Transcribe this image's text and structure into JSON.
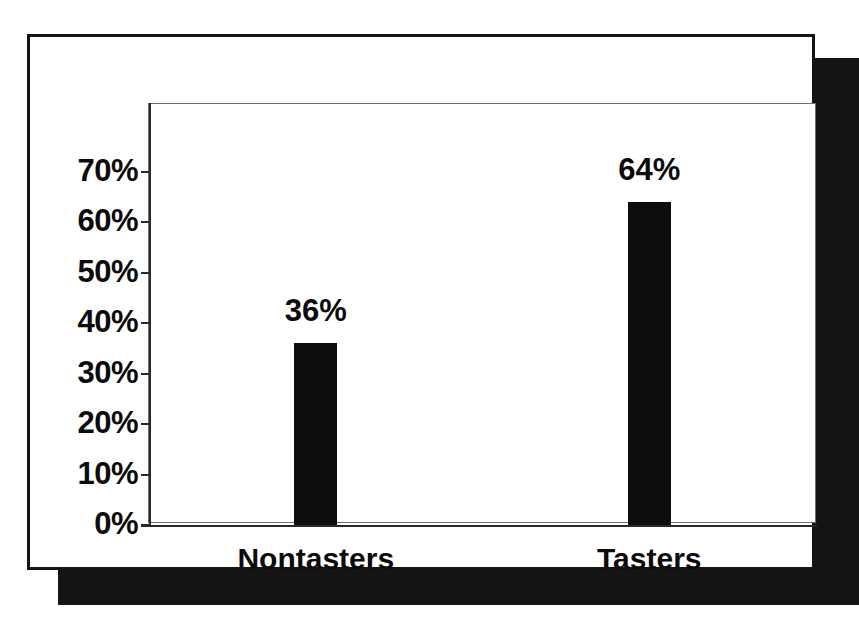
{
  "chart_data": {
    "type": "bar",
    "title": "",
    "subtitle": "",
    "xlabel": "",
    "ylabel": "",
    "categories": [
      "Nontasters",
      "Tasters"
    ],
    "values": [
      36,
      64
    ],
    "value_labels": [
      "36%",
      "64%"
    ],
    "ylim": [
      0,
      75
    ],
    "ytick_values": [
      0,
      10,
      20,
      30,
      40,
      50,
      60,
      70
    ],
    "ytick_labels": [
      "0%",
      "10%",
      "20%",
      "30%",
      "40%",
      "50%",
      "60%",
      "70%"
    ],
    "grid": false,
    "legend": null,
    "legend_position": "none",
    "series": [
      {
        "name": "Percent",
        "values": [
          36,
          64
        ]
      }
    ],
    "annotations": [],
    "colors": {
      "bar_fill": "#0d0d0d",
      "axis": "#2a2a2a",
      "text": "#0b0b0b",
      "plot_background": "#ffffff",
      "panel_background": "#ffffff",
      "panel_border": "#141414",
      "plot_frame_border": "#6e6e6e",
      "drop_shadow": "#141414"
    }
  }
}
